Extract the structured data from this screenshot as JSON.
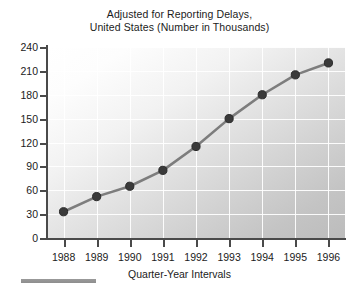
{
  "chart_data": {
    "type": "line",
    "title": "Adjusted for Reporting Delays, United States (Number in Thousands)",
    "title_lines": [
      "Adjusted for Reporting Delays,",
      "United States (Number in Thousands)"
    ],
    "xlabel": "Quarter-Year Intervals",
    "ylabel": "",
    "categories": [
      "1988",
      "1989",
      "1990",
      "1991",
      "1992",
      "1993",
      "1994",
      "1995",
      "1996"
    ],
    "values": [
      33,
      52,
      65,
      85,
      115,
      150,
      180,
      205,
      220
    ],
    "x": [
      1988,
      1989,
      1990,
      1991,
      1992,
      1993,
      1994,
      1995,
      1996
    ],
    "ylim": [
      0,
      240
    ],
    "yticks": [
      0,
      30,
      60,
      90,
      120,
      150,
      180,
      210,
      240
    ],
    "ytick_labels": [
      "0",
      "30",
      "60",
      "90",
      "120",
      "150",
      "180",
      "210",
      "240"
    ],
    "xtick_labels": [
      "1988",
      "1989",
      "1990",
      "1991",
      "1992",
      "1993",
      "1994",
      "1995",
      "1996"
    ],
    "grid": true,
    "grid_color": "#ffffff",
    "legend": null,
    "legend_position": "none",
    "series": [
      {
        "name": "Adjusted for reporting delays",
        "values": [
          33,
          52,
          65,
          85,
          115,
          150,
          180,
          205,
          220
        ],
        "line_color": "#7d7d7d",
        "marker_color": "#3a3a3a",
        "marker": "circle"
      }
    ],
    "plot_background": "gradient white to gray",
    "axis_color": "#4a4a4a"
  },
  "figure": {
    "background_color": "#ffffff",
    "footer_rule_color": "#969696"
  }
}
